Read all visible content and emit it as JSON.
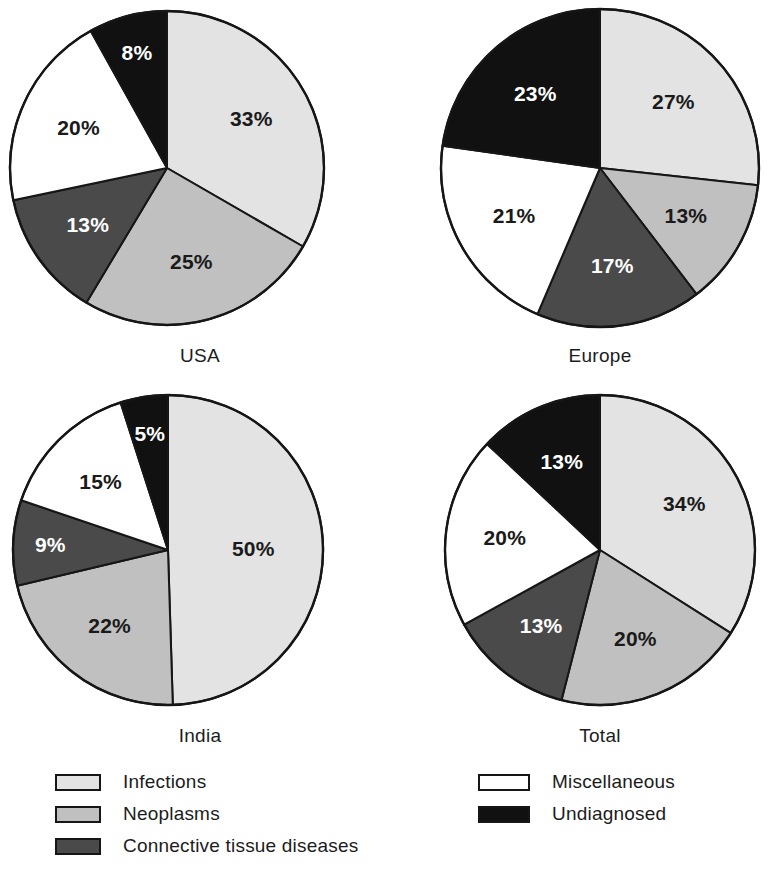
{
  "figure": {
    "width": 769,
    "height": 872
  },
  "palette": {
    "infections": "#e3e3e3",
    "neoplasms": "#c0c0c0",
    "connective": "#4a4a4a",
    "miscellaneous": "#ffffff",
    "undiagnosed": "#111111",
    "outline": "#161616",
    "text": "#1c1c1c"
  },
  "legend": {
    "left_column": [
      {
        "label": "Infections",
        "color": "#e3e3e3",
        "swatch": "light-gray-swatch"
      },
      {
        "label": "Neoplasms",
        "color": "#c0c0c0",
        "swatch": "medium-gray-swatch"
      },
      {
        "label": "Connective tissue diseases",
        "color": "#4a4a4a",
        "swatch": "dark-gray-swatch"
      }
    ],
    "right_column": [
      {
        "label": "Miscellaneous",
        "color": "#ffffff",
        "swatch": "white-swatch"
      },
      {
        "label": "Undiagnosed",
        "color": "#111111",
        "swatch": "black-swatch"
      }
    ]
  },
  "chart_data": [
    {
      "type": "pie",
      "title": "USA",
      "categories": [
        "Infections",
        "Neoplasms",
        "Connective tissue diseases",
        "Miscellaneous",
        "Undiagnosed"
      ],
      "values": [
        33,
        25,
        13,
        20,
        8
      ],
      "labels": [
        "33%",
        "25%",
        "13%",
        "20%",
        "8%"
      ],
      "colors": [
        "#e3e3e3",
        "#c0c0c0",
        "#4a4a4a",
        "#ffffff",
        "#111111"
      ],
      "label_colors": [
        "dark",
        "dark",
        "light",
        "dark",
        "light"
      ],
      "units": "percent",
      "start_angle_deg": 0,
      "direction": "clockwise",
      "center": {
        "cx": 167,
        "cy": 168
      },
      "radius": 157,
      "title_y": 345
    },
    {
      "type": "pie",
      "title": "Europe",
      "categories": [
        "Infections",
        "Neoplasms",
        "Connective tissue diseases",
        "Miscellaneous",
        "Undiagnosed"
      ],
      "values": [
        27,
        13,
        17,
        21,
        23
      ],
      "labels": [
        "27%",
        "13%",
        "17%",
        "21%",
        "23%"
      ],
      "colors": [
        "#e3e3e3",
        "#c0c0c0",
        "#4a4a4a",
        "#ffffff",
        "#111111"
      ],
      "label_colors": [
        "dark",
        "dark",
        "light",
        "dark",
        "light"
      ],
      "units": "percent",
      "start_angle_deg": 0,
      "direction": "clockwise",
      "center": {
        "cx": 600,
        "cy": 168
      },
      "radius": 159,
      "title_y": 345
    },
    {
      "type": "pie",
      "title": "India",
      "categories": [
        "Infections",
        "Neoplasms",
        "Connective tissue diseases",
        "Miscellaneous",
        "Undiagnosed"
      ],
      "values": [
        50,
        22,
        9,
        15,
        5
      ],
      "labels": [
        "50%",
        "22%",
        "9%",
        "15%",
        "5%"
      ],
      "colors": [
        "#e3e3e3",
        "#c0c0c0",
        "#4a4a4a",
        "#ffffff",
        "#111111"
      ],
      "label_colors": [
        "dark",
        "dark",
        "light",
        "dark",
        "light"
      ],
      "units": "percent",
      "start_angle_deg": 0,
      "direction": "clockwise",
      "center": {
        "cx": 168,
        "cy": 550
      },
      "radius": 155,
      "title_y": 725
    },
    {
      "type": "pie",
      "title": "Total",
      "categories": [
        "Infections",
        "Neoplasms",
        "Connective tissue diseases",
        "Miscellaneous",
        "Undiagnosed"
      ],
      "values": [
        34,
        20,
        13,
        20,
        13
      ],
      "labels": [
        "34%",
        "20%",
        "13%",
        "20%",
        "13%"
      ],
      "colors": [
        "#e3e3e3",
        "#c0c0c0",
        "#4a4a4a",
        "#ffffff",
        "#111111"
      ],
      "label_colors": [
        "dark",
        "dark",
        "light",
        "dark",
        "light"
      ],
      "units": "percent",
      "start_angle_deg": 0,
      "direction": "clockwise",
      "center": {
        "cx": 600,
        "cy": 550
      },
      "radius": 155,
      "title_y": 725
    }
  ]
}
